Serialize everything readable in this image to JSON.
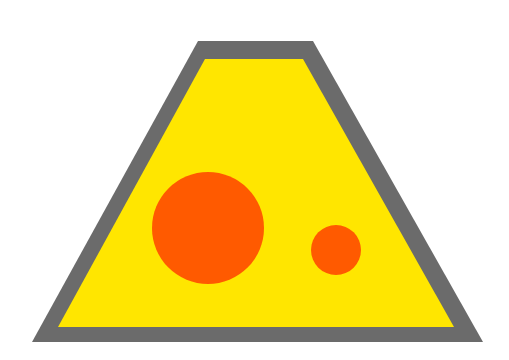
{
  "image": {
    "width": 509,
    "height": 360,
    "background": "#ffffff"
  },
  "shape": {
    "name": "trapezoid-sign",
    "outer_border": {
      "color": "#6b6b6b",
      "points": "198,41 313,41 483,342 32,342"
    },
    "inner_fill": {
      "color": "#ffe600",
      "points": "205,59 303,59 454,327 58,327"
    },
    "circles": [
      {
        "name": "large-circle",
        "cx": 208,
        "cy": 228,
        "r": 56,
        "color": "#ff5a00"
      },
      {
        "name": "small-circle",
        "cx": 336,
        "cy": 250,
        "r": 25,
        "color": "#ff5a00"
      }
    ]
  }
}
